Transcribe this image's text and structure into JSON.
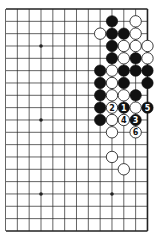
{
  "diagram": {
    "type": "go-board-partial",
    "board_size": 19,
    "visible_cols": [
      6,
      18
    ],
    "visible_rows": [
      0,
      18
    ],
    "edges": {
      "top": true,
      "right": true,
      "bottom": true,
      "left": false
    },
    "hoshi": [
      [
        9,
        3
      ],
      [
        15,
        3
      ],
      [
        9,
        9
      ],
      [
        15,
        9
      ],
      [
        9,
        15
      ],
      [
        15,
        15
      ]
    ],
    "colors": {
      "black": "#111111",
      "white": "#ffffff",
      "line": "#222222",
      "background": "#ffffff"
    },
    "stones": [
      {
        "c": 15,
        "r": 1,
        "color": "black"
      },
      {
        "c": 17,
        "r": 1,
        "color": "white"
      },
      {
        "c": 14,
        "r": 2,
        "color": "white"
      },
      {
        "c": 15,
        "r": 2,
        "color": "black"
      },
      {
        "c": 16,
        "r": 2,
        "color": "black"
      },
      {
        "c": 17,
        "r": 2,
        "color": "white"
      },
      {
        "c": 15,
        "r": 3,
        "color": "black"
      },
      {
        "c": 16,
        "r": 3,
        "color": "white"
      },
      {
        "c": 17,
        "r": 3,
        "color": "white"
      },
      {
        "c": 18,
        "r": 3,
        "color": "white"
      },
      {
        "c": 15,
        "r": 4,
        "color": "black"
      },
      {
        "c": 16,
        "r": 4,
        "color": "white"
      },
      {
        "c": 17,
        "r": 4,
        "color": "black"
      },
      {
        "c": 18,
        "r": 4,
        "color": "white"
      },
      {
        "c": 14,
        "r": 5,
        "color": "black"
      },
      {
        "c": 15,
        "r": 5,
        "color": "white"
      },
      {
        "c": 16,
        "r": 5,
        "color": "black"
      },
      {
        "c": 17,
        "r": 5,
        "color": "black"
      },
      {
        "c": 18,
        "r": 5,
        "color": "black"
      },
      {
        "c": 14,
        "r": 6,
        "color": "black"
      },
      {
        "c": 15,
        "r": 6,
        "color": "white"
      },
      {
        "c": 16,
        "r": 6,
        "color": "black"
      },
      {
        "c": 18,
        "r": 6,
        "color": "black"
      },
      {
        "c": 14,
        "r": 7,
        "color": "black"
      },
      {
        "c": 15,
        "r": 7,
        "color": "white"
      },
      {
        "c": 16,
        "r": 7,
        "color": "white"
      },
      {
        "c": 17,
        "r": 7,
        "color": "black"
      },
      {
        "c": 14,
        "r": 8,
        "color": "black"
      },
      {
        "c": 15,
        "r": 8,
        "color": "white",
        "label": "2"
      },
      {
        "c": 16,
        "r": 8,
        "color": "black",
        "label": "1"
      },
      {
        "c": 17,
        "r": 8,
        "color": "white"
      },
      {
        "c": 18,
        "r": 8,
        "color": "black",
        "label": "5"
      },
      {
        "c": 14,
        "r": 9,
        "color": "black"
      },
      {
        "c": 15,
        "r": 9,
        "color": "white"
      },
      {
        "c": 16,
        "r": 9,
        "color": "white",
        "label": "4"
      },
      {
        "c": 17,
        "r": 9,
        "color": "black",
        "label": "3"
      },
      {
        "c": 15,
        "r": 10,
        "color": "white"
      },
      {
        "c": 17,
        "r": 10,
        "color": "white",
        "label": "6"
      },
      {
        "c": 15,
        "r": 12,
        "color": "white"
      },
      {
        "c": 16,
        "r": 13,
        "color": "white"
      }
    ]
  }
}
